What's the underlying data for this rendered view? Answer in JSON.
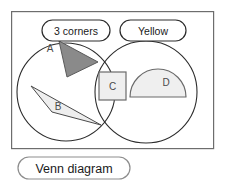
{
  "diagram": {
    "type": "venn",
    "caption": "Venn diagram",
    "sets": [
      {
        "id": "left",
        "label": "3 corners",
        "cx": 66,
        "cy": 92,
        "r": 49
      },
      {
        "id": "right",
        "label": "Yellow",
        "cx": 146,
        "cy": 92,
        "r": 51
      }
    ],
    "items": [
      {
        "label": "A",
        "shape": "triangle",
        "region": "3 corners only",
        "fill": "#8a8a8a",
        "points": "59,41 98,62 67,77",
        "label_x": 50,
        "label_y": 48
      },
      {
        "label": "B",
        "shape": "triangle",
        "region": "3 corners only",
        "fill": "#eeeeee",
        "points": "31,86 101,125 52,112",
        "label_x": 58,
        "label_y": 106
      },
      {
        "label": "C",
        "shape": "square",
        "region": "intersection",
        "fill": "#efefef",
        "x": 99,
        "y": 72,
        "width": 27,
        "height": 28,
        "label_x": 112,
        "label_y": 86
      },
      {
        "label": "D",
        "shape": "semicircle",
        "region": "Yellow only",
        "fill": "#efefef",
        "cx": 158,
        "cy": 97,
        "r": 28,
        "label_x": 166,
        "label_y": 82
      }
    ],
    "colors": {
      "frame_stroke": "#6d6d6d",
      "circle_stroke": "#2c2c2c",
      "shape_a_fill": "#8a8a8a",
      "shape_light_fill": "#efefef",
      "text": "#1a1a1a"
    },
    "frame": {
      "x": 11,
      "y": 11,
      "width": 203,
      "height": 138
    },
    "label_pills": [
      {
        "id": "left",
        "text": "3 corners",
        "x": 42,
        "y": 20,
        "width": 68,
        "height": 21
      },
      {
        "id": "right",
        "text": "Yellow",
        "x": 120,
        "y": 20,
        "width": 66,
        "height": 21
      }
    ],
    "caption_pill": {
      "x": 18,
      "y": 157,
      "width": 112,
      "height": 22
    }
  }
}
